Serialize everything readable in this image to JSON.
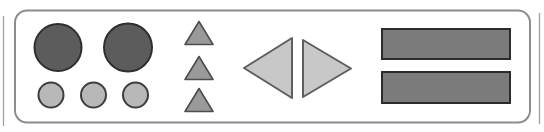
{
  "canvas": {
    "width": 544,
    "height": 132,
    "background": "#ffffff"
  },
  "card": {
    "name": "rounded-shape-card",
    "x": 15,
    "y": 10.5,
    "width": 515,
    "height": 112,
    "radius": 12,
    "fill": "#ffffff",
    "stroke": "#8c8c8c",
    "stroke_width": 2
  },
  "edge_fragments": [
    {
      "name": "left-neighbor-edge-line",
      "x1": 3.5,
      "y1": 16,
      "x2": 3.5,
      "y2": 126,
      "stroke": "#a3a3a3",
      "stroke_width": 1.3
    },
    {
      "name": "right-neighbor-edge-line",
      "x1": 539.5,
      "y1": 13,
      "x2": 539.5,
      "y2": 124,
      "stroke": "#9e9e9e",
      "stroke_width": 1.3
    }
  ],
  "shapes": [
    {
      "name": "large-dark-circle-1",
      "type": "circle",
      "cx": 58,
      "cy": 47.5,
      "r": 23.5,
      "fill": "#5c5c5c",
      "stroke": "#2f2f2f",
      "stroke_width": 2
    },
    {
      "name": "large-dark-circle-2",
      "type": "circle",
      "cx": 128,
      "cy": 47.5,
      "r": 24,
      "fill": "#5c5c5c",
      "stroke": "#2f2f2f",
      "stroke_width": 2
    },
    {
      "name": "small-light-circle-1",
      "type": "circle",
      "cx": 51,
      "cy": 95,
      "r": 12.5,
      "fill": "#b8b8b8",
      "stroke": "#3d3d3d",
      "stroke_width": 2
    },
    {
      "name": "small-light-circle-2",
      "type": "circle",
      "cx": 93.5,
      "cy": 95,
      "r": 12.5,
      "fill": "#b8b8b8",
      "stroke": "#3d3d3d",
      "stroke_width": 2
    },
    {
      "name": "small-light-circle-3",
      "type": "circle",
      "cx": 135.5,
      "cy": 95,
      "r": 12.5,
      "fill": "#b8b8b8",
      "stroke": "#3d3d3d",
      "stroke_width": 2
    },
    {
      "name": "up-triangle-1",
      "type": "polygon",
      "points": "199,21.5 213,44.5 185,44.5",
      "fill": "#9a9a9a",
      "stroke": "#4d4d4d",
      "stroke_width": 1.6
    },
    {
      "name": "up-triangle-2",
      "type": "polygon",
      "points": "199,56.5 213,79.5 185,79.5",
      "fill": "#9a9a9a",
      "stroke": "#4d4d4d",
      "stroke_width": 1.6
    },
    {
      "name": "up-triangle-3",
      "type": "polygon",
      "points": "199,88.5 213,111.5 185,111.5",
      "fill": "#9a9a9a",
      "stroke": "#4d4d4d",
      "stroke_width": 1.6
    },
    {
      "name": "left-pointing-triangle",
      "type": "polygon",
      "points": "244,68 292,38 292,98",
      "fill": "#c8c8c8",
      "stroke": "#5e5e5e",
      "stroke_width": 2
    },
    {
      "name": "right-pointing-triangle",
      "type": "polygon",
      "points": "303,40 351,68.5 303,97",
      "fill": "#c8c8c8",
      "stroke": "#5e5e5e",
      "stroke_width": 2
    },
    {
      "name": "gray-bar-1",
      "type": "rect",
      "x": 382,
      "y": 29,
      "width": 128,
      "height": 30,
      "fill": "#7b7b7b",
      "stroke": "#2b2b2b",
      "stroke_width": 2
    },
    {
      "name": "gray-bar-2",
      "type": "rect",
      "x": 382,
      "y": 72,
      "width": 128,
      "height": 31,
      "fill": "#7b7b7b",
      "stroke": "#2b2b2b",
      "stroke_width": 2
    }
  ]
}
